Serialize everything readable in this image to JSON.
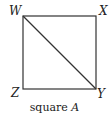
{
  "figure": {
    "title": "square A",
    "caption_word": "square",
    "caption_letter": "A",
    "shape": "square",
    "stroke_color": "#333333",
    "vertices": {
      "top_left": "W",
      "top_right": "X",
      "bottom_right": "Y",
      "bottom_left": "Z"
    },
    "segments": [
      {
        "from": "W",
        "to": "X"
      },
      {
        "from": "X",
        "to": "Y"
      },
      {
        "from": "Y",
        "to": "Z"
      },
      {
        "from": "Z",
        "to": "W"
      },
      {
        "from": "W",
        "to": "Y",
        "type": "diagonal"
      }
    ]
  }
}
